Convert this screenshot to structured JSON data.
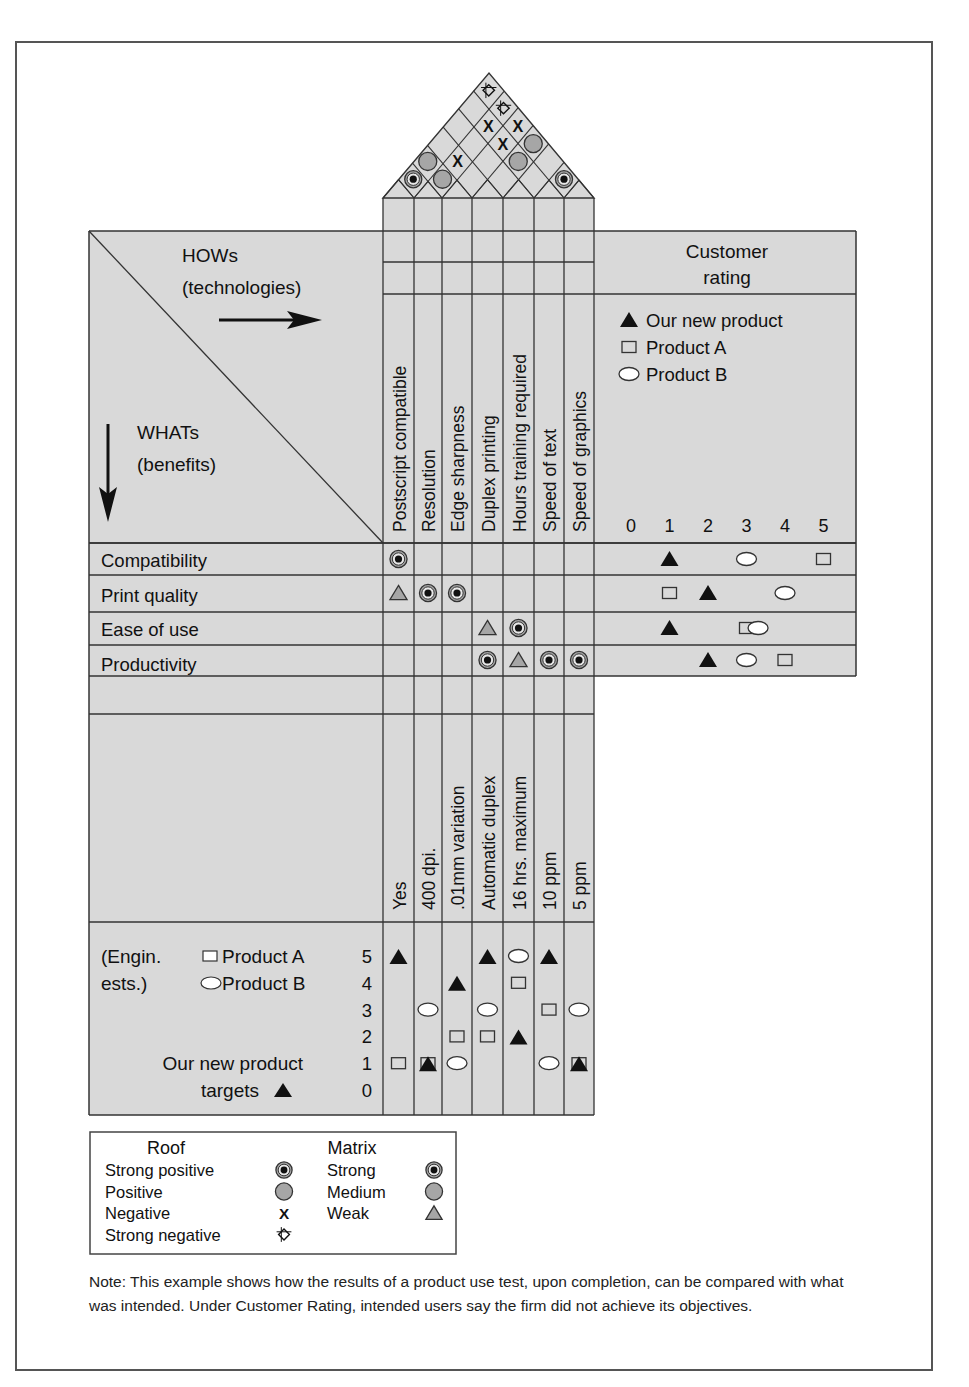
{
  "header_cell": {
    "hows_title": "HOWs",
    "hows_subtitle": "(technologies)",
    "whats_title": "WHATs",
    "whats_subtitle": "(benefits)"
  },
  "hows": [
    {
      "label": "Postscript compatible",
      "target": "Yes"
    },
    {
      "label": "Resolution",
      "target": "400 dpi."
    },
    {
      "label": "Edge sharpness",
      "target": ".01mm variation"
    },
    {
      "label": "Duplex printing",
      "target": "Automatic duplex"
    },
    {
      "label": "Hours training required",
      "target": "16 hrs. maximum"
    },
    {
      "label": "Speed of text",
      "target": "10 ppm"
    },
    {
      "label": "Speed of graphics",
      "target": "5 ppm"
    }
  ],
  "whats": [
    {
      "label": "Compatibility"
    },
    {
      "label": "Print quality"
    },
    {
      "label": "Ease of use"
    },
    {
      "label": "Productivity"
    }
  ],
  "roof": [
    {
      "i": 1,
      "j": 2,
      "symbol": "strong-positive"
    },
    {
      "i": 1,
      "j": 3,
      "symbol": "positive"
    },
    {
      "i": 2,
      "j": 3,
      "symbol": "positive"
    },
    {
      "i": 2,
      "j": 4,
      "symbol": "negative"
    },
    {
      "i": 2,
      "j": 6,
      "symbol": "negative"
    },
    {
      "i": 3,
      "j": 7,
      "symbol": "negative"
    },
    {
      "i": 3,
      "j": 6,
      "symbol": "negative"
    },
    {
      "i": 4,
      "j": 7,
      "symbol": "positive"
    },
    {
      "i": 4,
      "j": 6,
      "symbol": "positive"
    },
    {
      "i": 6,
      "j": 7,
      "symbol": "strong-positive"
    },
    {
      "i": 1,
      "j": 7,
      "symbol": "strong-negative"
    },
    {
      "i": 2,
      "j": 7,
      "symbol": "strong-negative"
    }
  ],
  "matrix": [
    {
      "row": 1,
      "col": 1,
      "symbol": "strong"
    },
    {
      "row": 2,
      "col": 1,
      "symbol": "weak"
    },
    {
      "row": 2,
      "col": 2,
      "symbol": "strong"
    },
    {
      "row": 2,
      "col": 3,
      "symbol": "strong"
    },
    {
      "row": 3,
      "col": 4,
      "symbol": "weak"
    },
    {
      "row": 3,
      "col": 5,
      "symbol": "strong"
    },
    {
      "row": 4,
      "col": 4,
      "symbol": "strong"
    },
    {
      "row": 4,
      "col": 5,
      "symbol": "weak"
    },
    {
      "row": 4,
      "col": 6,
      "symbol": "strong"
    },
    {
      "row": 4,
      "col": 7,
      "symbol": "strong"
    }
  ],
  "customer_rating": {
    "title_line1": "Customer",
    "title_line2": "rating",
    "legend": [
      {
        "symbol": "triangle",
        "label": "Our new product"
      },
      {
        "symbol": "square",
        "label": "Product A"
      },
      {
        "symbol": "ellipse",
        "label": "Product B"
      }
    ],
    "scale": [
      "0",
      "1",
      "2",
      "3",
      "4",
      "5"
    ],
    "ratings": [
      {
        "what": "Compatibility",
        "our_new_product": 1,
        "product_a": 5,
        "product_b": 3
      },
      {
        "what": "Print quality",
        "our_new_product": 2,
        "product_a": 1,
        "product_b": 4
      },
      {
        "what": "Ease of use",
        "our_new_product": 1,
        "product_a": 3,
        "product_b": 3.3
      },
      {
        "what": "Productivity",
        "our_new_product": 2,
        "product_a": 4,
        "product_b": 3
      }
    ]
  },
  "engineering": {
    "label_line1": "(Engin.",
    "label_line2": "ests.)",
    "legend_a": "Product A",
    "legend_b": "Product B",
    "targets_line1": "Our new product",
    "targets_line2": "targets",
    "scale": [
      "5",
      "4",
      "3",
      "2",
      "1",
      "0"
    ],
    "values": [
      {
        "how": "Postscript compatible",
        "our_new_product": 5,
        "product_a": 1,
        "product_b": null
      },
      {
        "how": "Resolution",
        "our_new_product": 1,
        "product_a": 1,
        "product_b": 3
      },
      {
        "how": "Edge sharpness",
        "our_new_product": 4,
        "product_a": 2,
        "product_b": 1
      },
      {
        "how": "Duplex printing",
        "our_new_product": 5,
        "product_a": 2,
        "product_b": 3
      },
      {
        "how": "Hours training required",
        "our_new_product": 2,
        "product_a": 4,
        "product_b": 5
      },
      {
        "how": "Speed of text",
        "our_new_product": 5,
        "product_a": 3,
        "product_b": 1
      },
      {
        "how": "Speed of graphics",
        "our_new_product": 1,
        "product_a": 1,
        "product_b": 3
      }
    ]
  },
  "legend": {
    "roof_title": "Roof",
    "roof_items": [
      {
        "label": "Strong positive",
        "symbol": "strong-positive"
      },
      {
        "label": "Positive",
        "symbol": "positive"
      },
      {
        "label": "Negative",
        "symbol": "negative"
      },
      {
        "label": "Strong negative",
        "symbol": "strong-negative"
      }
    ],
    "matrix_title": "Matrix",
    "matrix_items": [
      {
        "label": "Strong",
        "symbol": "strong"
      },
      {
        "label": "Medium",
        "symbol": "medium"
      },
      {
        "label": "Weak",
        "symbol": "weak"
      }
    ]
  },
  "note": "Note:  This example shows how the results of a product use test, upon completion, can be compared with what was intended. Under Customer Rating, intended users say the firm did not achieve its objectives.",
  "colors": {
    "panel_fill": "#d9d9d9",
    "line": "#333333",
    "symbol_gray": "#a6a6a6",
    "symbol_black": "#111111"
  }
}
